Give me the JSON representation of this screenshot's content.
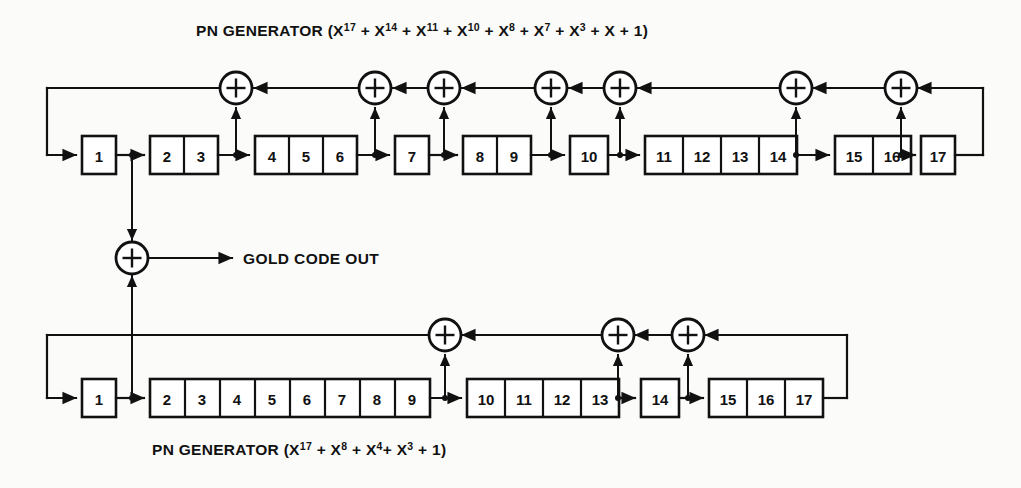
{
  "diagram": {
    "title_top": "PN GENERATOR (X17 + X14 + X11 + X10 + X8 + X7 + X3 + X + 1)",
    "title_bottom": "PN GENERATOR (X17 + X8 + X4+ X3 + 1)",
    "output_label": "GOLD CODE OUT",
    "ink_color": "#111111",
    "background_color": "#fbfbfa",
    "top_generator": {
      "name": "PN GENERATOR",
      "polynomial_text": "(X17 + X14 + X11 + X10 + X8 + X7 + X3 + X + 1)",
      "polynomial_terms": [
        "X17",
        "X14",
        "X11",
        "X10",
        "X8",
        "X7",
        "X3",
        "X",
        "1"
      ],
      "stage_count": 17,
      "cells": [
        "1",
        "2",
        "3",
        "4",
        "5",
        "6",
        "7",
        "8",
        "9",
        "10",
        "11",
        "12",
        "13",
        "14",
        "15",
        "16",
        "17"
      ],
      "groups": [
        {
          "cells": [
            "1"
          ]
        },
        {
          "cells": [
            "2",
            "3"
          ]
        },
        {
          "cells": [
            "4",
            "5",
            "6"
          ]
        },
        {
          "cells": [
            "7"
          ]
        },
        {
          "cells": [
            "8",
            "9"
          ]
        },
        {
          "cells": [
            "10"
          ]
        },
        {
          "cells": [
            "11",
            "12",
            "13",
            "14"
          ]
        },
        {
          "cells": [
            "15",
            "16"
          ]
        },
        {
          "cells": [
            "17"
          ]
        }
      ],
      "xor_count": 7,
      "tap_after_stages": [
        3,
        6,
        7,
        9,
        10,
        14,
        16
      ]
    },
    "bottom_generator": {
      "name": "PN GENERATOR",
      "polynomial_text": "(X17 + X8 + X4+ X3 + 1)",
      "polynomial_terms": [
        "X17",
        "X8",
        "X4",
        "X3",
        "1"
      ],
      "stage_count": 17,
      "cells": [
        "1",
        "2",
        "3",
        "4",
        "5",
        "6",
        "7",
        "8",
        "9",
        "10",
        "11",
        "12",
        "13",
        "14",
        "15",
        "16",
        "17"
      ],
      "groups": [
        {
          "cells": [
            "1"
          ]
        },
        {
          "cells": [
            "2",
            "3",
            "4",
            "5",
            "6",
            "7",
            "8",
            "9"
          ]
        },
        {
          "cells": [
            "10",
            "11",
            "12",
            "13"
          ]
        },
        {
          "cells": [
            "14"
          ]
        },
        {
          "cells": [
            "15",
            "16",
            "17"
          ]
        }
      ],
      "xor_count": 3,
      "tap_after_stages": [
        9,
        13,
        14
      ]
    },
    "gold_xor": {
      "symbol": "+",
      "inputs": [
        "top-stage-1-output",
        "bottom-stage-1-output"
      ],
      "output": "GOLD CODE OUT"
    }
  }
}
